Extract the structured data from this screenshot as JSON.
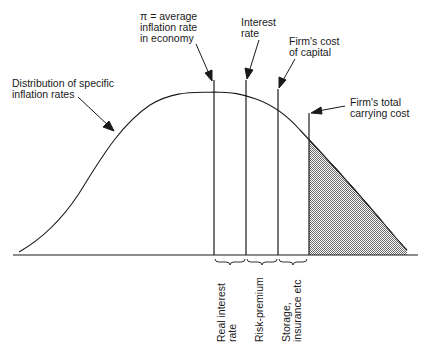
{
  "diagram": {
    "labels": {
      "distribution": "Distribution of specific\ninflation rates",
      "average_inflation": "π = average\ninflation rate\nin economy",
      "interest_rate": "Interest\nrate",
      "cost_of_capital": "Firm's cost\nof capital",
      "carrying_cost": "Firm's total\ncarrying cost"
    },
    "brace_labels": {
      "real_interest": "Real interest\nrate",
      "risk_premium": "Risk-premium",
      "storage": "Storage,\ninsurance etc"
    },
    "colors": {
      "line": "#1a1a1a",
      "shade": "#9a9a9a"
    }
  }
}
